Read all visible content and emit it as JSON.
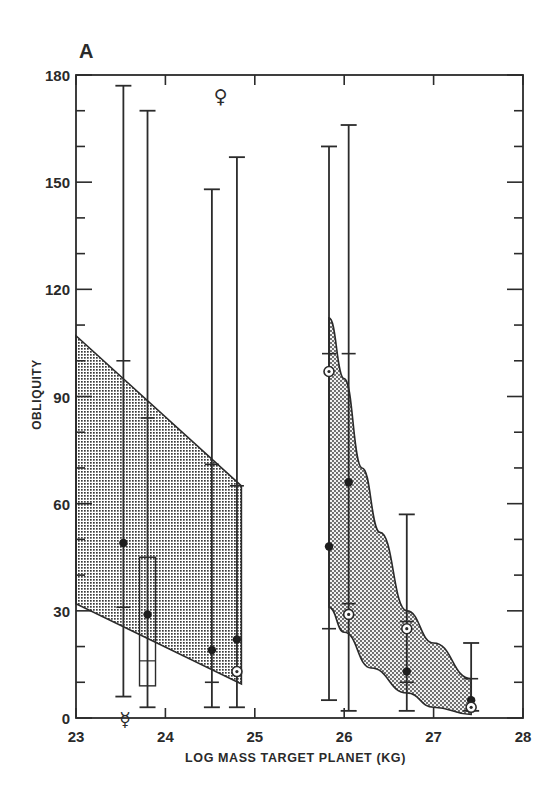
{
  "chart_data": {
    "type": "scatter",
    "panel_label": "A",
    "title": "",
    "xlabel": "LOG MASS TARGET PLANET (KG)",
    "ylabel": "OBLIQUITY",
    "xlim": [
      23,
      28
    ],
    "ylim": [
      0,
      180
    ],
    "x_ticks": [
      23,
      24,
      25,
      26,
      27,
      28
    ],
    "y_ticks": [
      0,
      30,
      60,
      90,
      120,
      150,
      180
    ],
    "grid": false,
    "legend": null,
    "shaded_regions": [
      {
        "name": "terrestrial-band",
        "upper": [
          [
            23.0,
            107
          ],
          [
            24.85,
            65
          ]
        ],
        "lower": [
          [
            23.0,
            32
          ],
          [
            24.85,
            9.5
          ]
        ],
        "pattern": "dense-dot-stipple"
      },
      {
        "name": "giant-planet-band",
        "upper": [
          [
            25.83,
            112
          ],
          [
            26.0,
            95
          ],
          [
            26.2,
            70
          ],
          [
            26.4,
            52
          ],
          [
            26.7,
            30
          ],
          [
            27.0,
            21
          ],
          [
            27.42,
            11
          ]
        ],
        "lower": [
          [
            25.83,
            31
          ],
          [
            26.0,
            24
          ],
          [
            26.3,
            14
          ],
          [
            26.7,
            7
          ],
          [
            27.0,
            3
          ],
          [
            27.42,
            1
          ]
        ],
        "pattern": "coarse-dot-stipple"
      }
    ],
    "error_bars": [
      {
        "x": 23.53,
        "low": 6,
        "high": 177,
        "inner_ticks": [
          100,
          31
        ],
        "point": 49,
        "marker": "filled-circle"
      },
      {
        "x": 23.8,
        "low": 3,
        "high": 170,
        "inner_ticks": [
          84
        ],
        "point": 29,
        "marker": "filled-circle",
        "box": [
          9,
          45
        ],
        "box_mid": 16
      },
      {
        "x": 24.52,
        "low": 3,
        "high": 148,
        "inner_ticks": [
          71,
          10
        ],
        "point": 19,
        "marker": "filled-circle"
      },
      {
        "x": 24.8,
        "low": 3,
        "high": 157,
        "inner_ticks": [
          65
        ],
        "point": 22,
        "marker": "filled-circle",
        "extra_point": 13,
        "extra_marker": "earth-symbol"
      },
      {
        "x": 25.83,
        "low": 5,
        "high": 160,
        "inner_ticks": [
          102,
          25
        ],
        "point": 48,
        "marker": "filled-circle",
        "extra_point": 97,
        "extra_marker": "uranus-symbol"
      },
      {
        "x": 26.05,
        "low": 2,
        "high": 166,
        "inner_ticks": [
          102,
          32
        ],
        "point": 66,
        "marker": "filled-circle",
        "extra_point": 29,
        "extra_marker": "neptune-symbol"
      },
      {
        "x": 26.7,
        "low": 2,
        "high": 57,
        "inner_ticks": [
          10,
          27
        ],
        "point": 13,
        "marker": "filled-circle",
        "extra_point": 25,
        "extra_marker": "saturn-symbol"
      },
      {
        "x": 27.42,
        "low": 2,
        "high": 21,
        "inner_ticks": [
          11
        ],
        "point": 5,
        "marker": "filled-circle",
        "extra_point": 3,
        "extra_marker": "jupiter-symbol"
      }
    ],
    "annotations": [
      {
        "symbol": "♀",
        "name": "venus",
        "x": 24.62,
        "y": 175
      },
      {
        "symbol": "☿",
        "name": "mercury",
        "x": 23.55,
        "y": 1
      }
    ]
  }
}
